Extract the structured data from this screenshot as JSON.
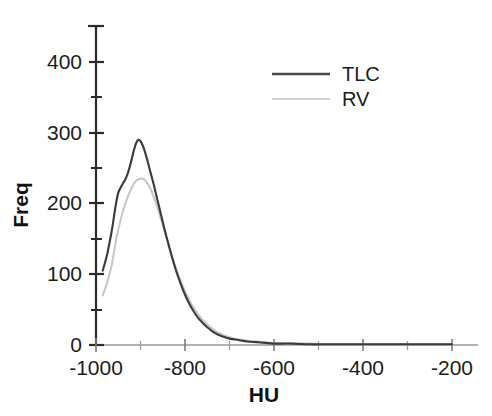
{
  "chart_data": {
    "type": "line",
    "title": "",
    "subtitle": "",
    "xlabel": "HU",
    "ylabel": "Freq",
    "xlim": [
      -1000,
      -200
    ],
    "ylim": [
      0,
      440
    ],
    "grid": false,
    "legend_position": "top-center",
    "x_ticks_major": [
      -1000,
      -800,
      -600,
      -400,
      -200
    ],
    "x_tick_labels": [
      "-1000",
      "-800",
      "-600",
      "-400",
      "-200"
    ],
    "x_ticks_minor": [
      -900,
      -700,
      -500,
      -300
    ],
    "y_ticks_major": [
      0,
      100,
      200,
      300,
      400
    ],
    "y_tick_labels": [
      "0",
      "100",
      "200",
      "300",
      "400"
    ],
    "y_ticks_minor": [
      50,
      150,
      250,
      350
    ],
    "series": [
      {
        "name": "TLC",
        "color": "#3b3b3b",
        "style": "solid",
        "peak_x": -905,
        "peak_y": 290,
        "x": [
          -985,
          -975,
          -965,
          -960,
          -955,
          -950,
          -945,
          -940,
          -935,
          -930,
          -925,
          -920,
          -915,
          -910,
          -905,
          -900,
          -895,
          -890,
          -885,
          -880,
          -875,
          -870,
          -865,
          -860,
          -855,
          -850,
          -845,
          -840,
          -830,
          -820,
          -810,
          -800,
          -790,
          -780,
          -770,
          -760,
          -750,
          -740,
          -730,
          -720,
          -710,
          -700,
          -690,
          -680,
          -660,
          -640,
          -620,
          -600,
          -560,
          -520,
          -480,
          -440,
          -400,
          -350,
          -300,
          -250,
          -200
        ],
        "y": [
          105,
          128,
          160,
          180,
          200,
          215,
          222,
          228,
          233,
          240,
          250,
          262,
          275,
          285,
          290,
          288,
          282,
          273,
          262,
          250,
          238,
          226,
          213,
          200,
          187,
          174,
          161,
          149,
          126,
          105,
          87,
          71,
          58,
          47,
          38,
          31,
          25,
          20,
          16,
          13,
          11,
          9,
          8,
          7,
          5,
          4,
          3,
          2,
          2,
          1,
          1,
          1,
          1,
          1,
          1,
          1,
          1
        ]
      },
      {
        "name": "RV",
        "color": "#c6c6c6",
        "style": "solid-light",
        "peak_x": -895,
        "peak_y": 235,
        "x": [
          -985,
          -975,
          -965,
          -960,
          -955,
          -950,
          -945,
          -940,
          -935,
          -930,
          -925,
          -920,
          -915,
          -910,
          -905,
          -900,
          -895,
          -890,
          -885,
          -880,
          -875,
          -870,
          -865,
          -860,
          -855,
          -850,
          -845,
          -840,
          -830,
          -820,
          -810,
          -800,
          -790,
          -780,
          -770,
          -760,
          -750,
          -740,
          -730,
          -720,
          -710,
          -700,
          -690,
          -680,
          -660,
          -640,
          -620,
          -600,
          -560,
          -520,
          -480,
          -440,
          -400,
          -350,
          -300,
          -250,
          -200
        ],
        "y": [
          70,
          88,
          112,
          130,
          148,
          163,
          176,
          188,
          198,
          207,
          215,
          222,
          228,
          232,
          234,
          235,
          235,
          233,
          229,
          224,
          217,
          209,
          200,
          190,
          180,
          170,
          159,
          148,
          127,
          108,
          91,
          76,
          63,
          52,
          43,
          35,
          29,
          24,
          19,
          16,
          13,
          11,
          9,
          8,
          6,
          5,
          4,
          3,
          2,
          2,
          1,
          1,
          1,
          1,
          1,
          1,
          1
        ]
      }
    ],
    "legend_entries": [
      {
        "label": "TLC",
        "color": "#4a4a4a"
      },
      {
        "label": "RV",
        "color": "#d2d2d2"
      }
    ]
  }
}
